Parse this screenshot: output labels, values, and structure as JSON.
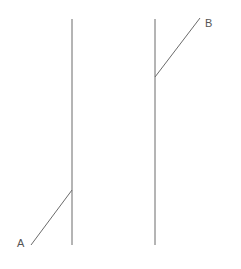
{
  "diagram": {
    "labels": {
      "a": "A",
      "b": "B"
    },
    "colors": {
      "background": "#ffffff",
      "line": "#6b6b6b",
      "label": "#555555"
    }
  }
}
